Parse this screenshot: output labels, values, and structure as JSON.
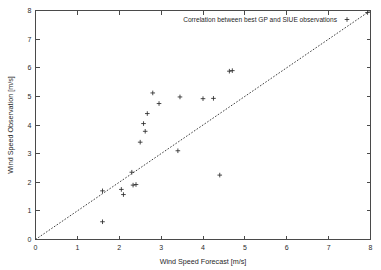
{
  "chart_data": {
    "type": "scatter",
    "title": "",
    "xlabel": "Wind Speed Forecast [m/s]",
    "ylabel": "Wind Speed Observation [m/s]",
    "xlim": [
      0,
      8
    ],
    "ylim": [
      0,
      8
    ],
    "xticks": [
      0,
      1,
      2,
      3,
      4,
      5,
      6,
      7,
      8
    ],
    "yticks": [
      0,
      1,
      2,
      3,
      4,
      5,
      6,
      7,
      8
    ],
    "xtick_labels": [
      "0",
      "1",
      "2",
      "3",
      "4",
      "5",
      "6",
      "7",
      "8"
    ],
    "ytick_labels": [
      "0",
      "1",
      "2",
      "3",
      "4",
      "5",
      "6",
      "7",
      "8"
    ],
    "grid": false,
    "legend_position": "top-right",
    "legend": [
      {
        "label": "Correlation between best GP and SIUE observations",
        "marker": "plus",
        "color": "#2a2a2a"
      }
    ],
    "reference_line": {
      "name": "one-to-one identity line",
      "style": "dotted",
      "color": "#2a2a2a",
      "from": [
        0,
        0
      ],
      "to": [
        8,
        8
      ]
    },
    "series": [
      {
        "name": "Correlation between best GP and SIUE observations",
        "marker": "plus",
        "color": "#2a2a2a",
        "points": [
          [
            1.6,
            0.62
          ],
          [
            1.6,
            1.7
          ],
          [
            2.05,
            1.75
          ],
          [
            2.1,
            1.57
          ],
          [
            2.33,
            1.9
          ],
          [
            2.4,
            1.92
          ],
          [
            2.3,
            2.35
          ],
          [
            2.5,
            3.4
          ],
          [
            2.58,
            4.05
          ],
          [
            2.62,
            3.78
          ],
          [
            2.67,
            4.4
          ],
          [
            2.8,
            5.12
          ],
          [
            2.95,
            4.75
          ],
          [
            3.4,
            3.1
          ],
          [
            3.45,
            4.98
          ],
          [
            4.0,
            4.92
          ],
          [
            4.25,
            4.93
          ],
          [
            4.4,
            2.25
          ],
          [
            4.63,
            5.88
          ],
          [
            4.7,
            5.9
          ],
          [
            7.93,
            7.93
          ]
        ]
      }
    ]
  }
}
